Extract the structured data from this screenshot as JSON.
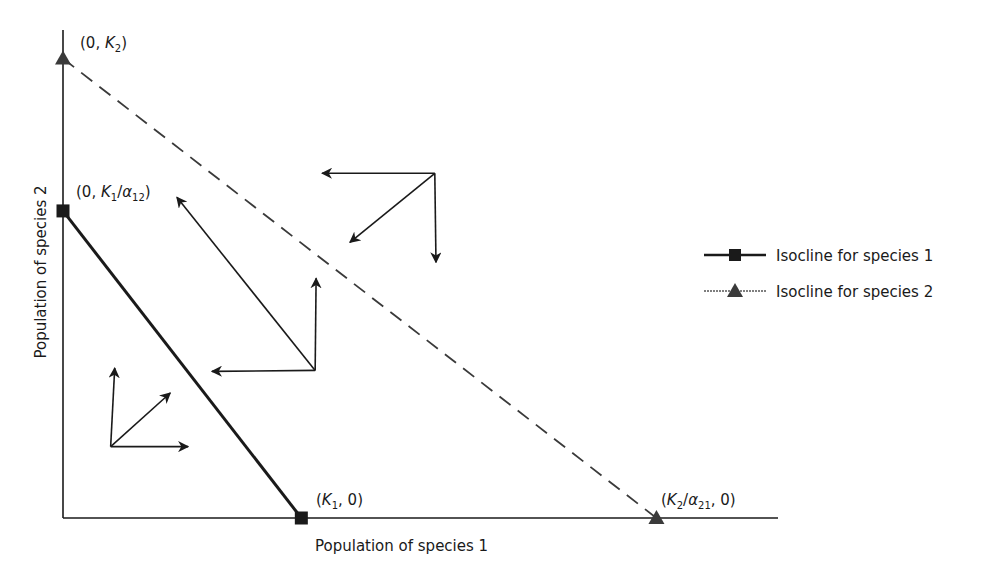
{
  "chart_data": {
    "type": "line",
    "title": "",
    "xlabel": "Population of species 1",
    "ylabel": "Population of species 2",
    "xlim": [
      0,
      300
    ],
    "ylim": [
      0,
      205
    ],
    "grid": false,
    "legend_placement": "right",
    "series": [
      {
        "name": "Isocline for species 1",
        "style": "solid",
        "marker": "square",
        "color": "#1a1a1a",
        "points": [
          {
            "x": 0,
            "y": 129,
            "label_parts": [
              "(0, ",
              "K",
              "1",
              "/",
              "α",
              "12",
              ")"
            ]
          },
          {
            "x": 100,
            "y": 0,
            "label_parts": [
              "(",
              "K",
              "1",
              ", 0)"
            ]
          }
        ]
      },
      {
        "name": "Isocline for species 2",
        "style": "dashed",
        "marker": "triangle",
        "color": "#3a3a3a",
        "points": [
          {
            "x": 0,
            "y": 193,
            "label_parts": [
              "(0, ",
              "K",
              "2",
              ")"
            ]
          },
          {
            "x": 249,
            "y": 0,
            "label_parts": [
              "(",
              "K",
              "2",
              "/",
              "α",
              "21",
              ", 0)"
            ]
          }
        ]
      }
    ],
    "point_labels": {
      "k2_y": {
        "open": "(0, ",
        "var": "K",
        "sub": "2",
        "close": ")"
      },
      "k1_over_a12": {
        "open": "(0, ",
        "var": "K",
        "sub": "1",
        "slash": "/",
        "greek": "α",
        "gsub": "12",
        "close": ")"
      },
      "k1_x": {
        "open": "(",
        "var": "K",
        "sub": "1",
        "close": ", 0)"
      },
      "k2_over_a21": {
        "open": "(",
        "var": "K",
        "sub": "2",
        "slash": "/",
        "greek": "α",
        "gsub": "21",
        "close": ", 0)"
      }
    },
    "vector_clusters": [
      {
        "name": "region-below-both",
        "origin": {
          "x": 20,
          "y": 30
        },
        "arrows": [
          {
            "to": {
              "x": 21.7,
              "y": 63
            }
          },
          {
            "to": {
              "x": 45,
              "y": 52.5
            }
          },
          {
            "to": {
              "x": 52.5,
              "y": 30
            }
          }
        ]
      },
      {
        "name": "region-between",
        "origin": {
          "x": 105.8,
          "y": 62
        },
        "arrows": [
          {
            "to": {
              "x": 106.2,
              "y": 100.7
            }
          },
          {
            "to": {
              "x": 47.8,
              "y": 134.7
            }
          },
          {
            "to": {
              "x": 62.5,
              "y": 61.6
            }
          }
        ]
      },
      {
        "name": "region-above-both",
        "origin": {
          "x": 156,
          "y": 144.8
        },
        "arrows": [
          {
            "to": {
              "x": 108.7,
              "y": 144.8
            }
          },
          {
            "to": {
              "x": 120.4,
              "y": 115.8
            }
          },
          {
            "to": {
              "x": 156.5,
              "y": 107.4
            }
          }
        ]
      }
    ]
  },
  "legend": {
    "items": [
      {
        "label": "Isocline for species 1",
        "marker": "square"
      },
      {
        "label": "Isocline for species 2",
        "marker": "triangle"
      }
    ]
  }
}
